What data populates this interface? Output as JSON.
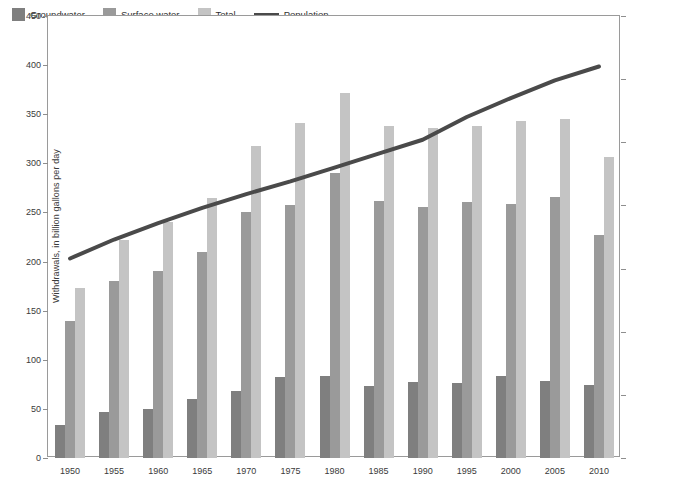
{
  "legend": {
    "items": [
      {
        "label": "Groundwater",
        "type": "swatch",
        "color": "#7f7f7f"
      },
      {
        "label": "Surface water",
        "type": "swatch",
        "color": "#9a9a9a"
      },
      {
        "label": "Total",
        "type": "swatch",
        "color": "#c4c4c4"
      },
      {
        "label": "Population",
        "type": "line",
        "color": "#4a4a4a"
      }
    ]
  },
  "axes": {
    "left": {
      "title": "Withdrawals, in billion gallons per day",
      "ticks": [
        "0",
        "50",
        "100",
        "150",
        "200",
        "250",
        "300",
        "350",
        "400",
        "450"
      ]
    },
    "right": {
      "title": "Population, in millions",
      "ticks": [
        "0",
        "50",
        "100",
        "150",
        "200",
        "250",
        "300",
        "350"
      ]
    }
  },
  "chart_data": {
    "type": "bar",
    "title": "",
    "xlabel": "",
    "ylabel": "Withdrawals, in billion gallons per day",
    "y2label": "Population, in millions",
    "ylim": [
      0,
      450
    ],
    "y2lim": [
      0,
      350
    ],
    "grid": false,
    "legend_position": "top-left",
    "categories": [
      "1950",
      "1955",
      "1960",
      "1965",
      "1970",
      "1975",
      "1980",
      "1985",
      "1990",
      "1995",
      "2000",
      "2005",
      "2010"
    ],
    "series": [
      {
        "name": "Groundwater",
        "color": "#7f7f7f",
        "axis": "left",
        "values": [
          34,
          47,
          50,
          60,
          68,
          82,
          83,
          73,
          77,
          76,
          83,
          78,
          74
        ]
      },
      {
        "name": "Surface water",
        "color": "#9a9a9a",
        "axis": "left",
        "values": [
          140,
          180,
          190,
          210,
          250,
          258,
          290,
          262,
          256,
          261,
          259,
          266,
          227
        ]
      },
      {
        "name": "Total",
        "color": "#c4c4c4",
        "axis": "left",
        "values": [
          173,
          222,
          240,
          265,
          318,
          341,
          372,
          338,
          336,
          338,
          343,
          345,
          306
        ]
      },
      {
        "name": "Population",
        "color": "#4a4a4a",
        "axis": "right",
        "type": "line",
        "values": [
          158,
          173,
          186,
          198,
          209,
          219,
          230,
          241,
          252,
          270,
          285,
          299,
          310
        ]
      }
    ]
  }
}
